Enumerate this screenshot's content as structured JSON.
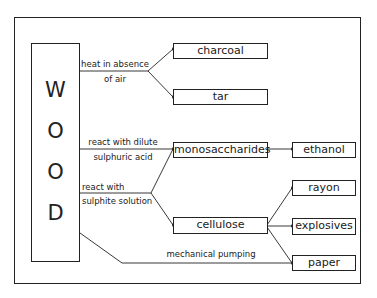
{
  "source": {
    "letters": [
      "W",
      "O",
      "O",
      "D"
    ]
  },
  "processes": {
    "heat": {
      "line1": "heat in absence",
      "line2": "of air"
    },
    "dilute": {
      "line1": "react with dilute",
      "line2": "sulphuric acid"
    },
    "sulphite": {
      "line1": "react with",
      "line2": "sulphite solution"
    },
    "mechanical": {
      "line1": "mechanical pumping"
    }
  },
  "products": {
    "charcoal": "charcoal",
    "tar": "tar",
    "monosaccharides": "monosaccharides",
    "ethanol": "ethanol",
    "cellulose": "cellulose",
    "rayon": "rayon",
    "explosives": "explosives",
    "paper": "paper"
  },
  "colors": {
    "line": "#222222",
    "background": "#ffffff"
  }
}
